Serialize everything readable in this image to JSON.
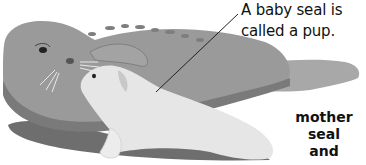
{
  "caption": {
    "line1": "A baby seal is",
    "line2": "called a pup."
  },
  "label": {
    "line1": "mother",
    "line2": "seal and",
    "line3": "pup"
  },
  "illustration": {
    "subject": "mother seal and pup",
    "colors": {
      "mother_body": "#9a9a9a",
      "mother_belly": "#8a8a8a",
      "mother_shadow": "#707070",
      "pup_body": "#e6e6e6",
      "pup_shadow": "#c8c8c8",
      "ground_shadow": "#6e6e6e"
    }
  }
}
